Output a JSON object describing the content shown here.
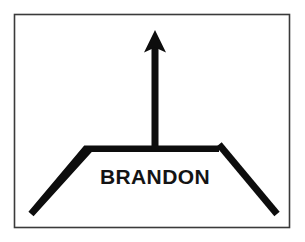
{
  "figure": {
    "name": "road-guide-sign-diagram",
    "type": "diagram",
    "width": 305,
    "height": 242,
    "background_color": "#ffffff"
  },
  "frame": {
    "name": "sign-border",
    "stroke_color": "#3a3a3a",
    "fill_color": "#ffffff",
    "stroke_width": 1.6,
    "x": 14.5,
    "y": 14.5,
    "width": 275,
    "height": 213
  },
  "graphic": {
    "ink_color": "#0d0d0d",
    "arrow": {
      "name": "up-arrow",
      "direction": "up",
      "tip_x": 155,
      "tip_y": 30,
      "head_left_x": 144,
      "head_right_x": 166,
      "head_base_y": 52,
      "shaft_left_x": 151.5,
      "shaft_right_x": 158.5,
      "shaft_bottom_y": 150,
      "shaft_width": 7
    },
    "road": {
      "name": "road-bar",
      "bar_left_x": 88,
      "bar_right_x": 219,
      "bar_top_y": 145.5,
      "bar_thickness": 6.5,
      "left_leg_end_x": 31,
      "left_leg_end_y": 214,
      "right_leg_end_x": 277,
      "right_leg_end_y": 214,
      "leg_thickness": 7
    }
  },
  "label": {
    "name": "destination-label",
    "text": "BRANDON",
    "center_x": 155,
    "baseline_y": 184,
    "font_size_px": 21,
    "font_weight": "bold",
    "text_color": "#141414",
    "text_anchor": "middle"
  }
}
